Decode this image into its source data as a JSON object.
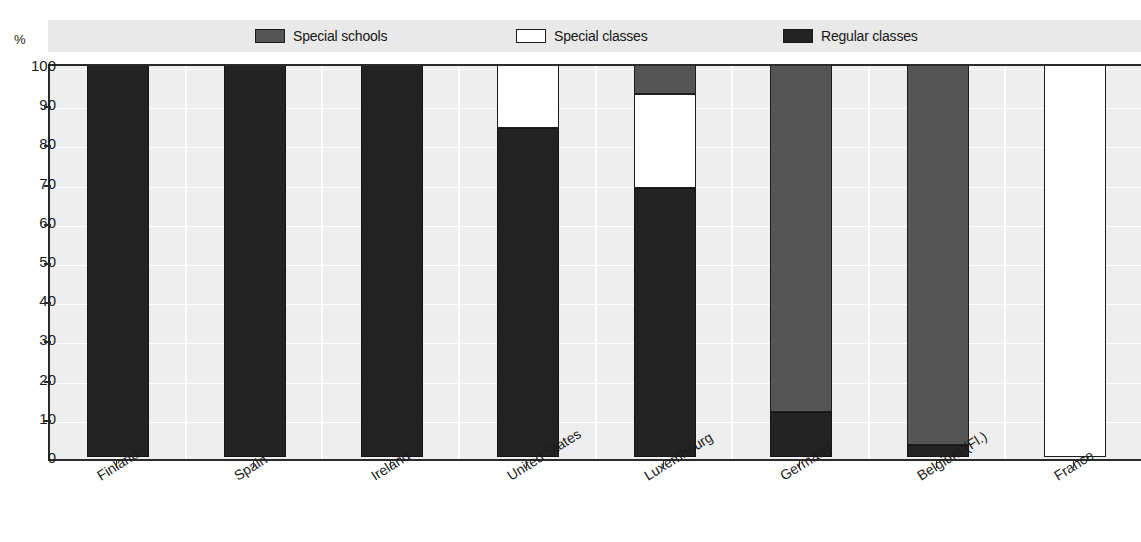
{
  "figure": {
    "title": "",
    "y_axis_unit": "%"
  },
  "legend": {
    "items": [
      {
        "label": "Special schools",
        "swatch": "gray-swatch-icon",
        "color": "#555555"
      },
      {
        "label": "Special classes",
        "swatch": "white-swatch-icon",
        "color": "#ffffff"
      },
      {
        "label": "Regular classes",
        "swatch": "black-swatch-icon",
        "color": "#232323"
      }
    ]
  },
  "chart_data": {
    "type": "bar",
    "stacked": true,
    "title": "",
    "xlabel": "",
    "ylabel": "%",
    "ylim": [
      0,
      100
    ],
    "yticks": [
      0,
      10,
      20,
      30,
      40,
      50,
      60,
      70,
      80,
      90,
      100
    ],
    "ytick_labels": [
      "0",
      "10",
      "20",
      "30",
      "40",
      "50",
      "60",
      "70",
      "80",
      "90",
      "100"
    ],
    "grid": true,
    "legend_position": "top",
    "categories": [
      "Finland",
      "Spain",
      "Ireland",
      "United States",
      "Luxembourg",
      "Germany",
      "Belgium (Fl.)",
      "France"
    ],
    "series": [
      {
        "name": "Regular classes",
        "color": "#232323",
        "values": [
          100,
          100,
          100,
          84,
          68.5,
          11.5,
          3,
          0
        ]
      },
      {
        "name": "Special classes",
        "color": "#ffffff",
        "values": [
          0,
          0,
          0,
          16,
          24,
          0,
          0,
          100
        ]
      },
      {
        "name": "Special schools",
        "color": "#555555",
        "values": [
          0,
          0,
          0,
          0,
          7.5,
          88.5,
          97,
          0
        ]
      }
    ],
    "stack_order": [
      "Regular classes",
      "Special classes",
      "Special schools"
    ]
  }
}
